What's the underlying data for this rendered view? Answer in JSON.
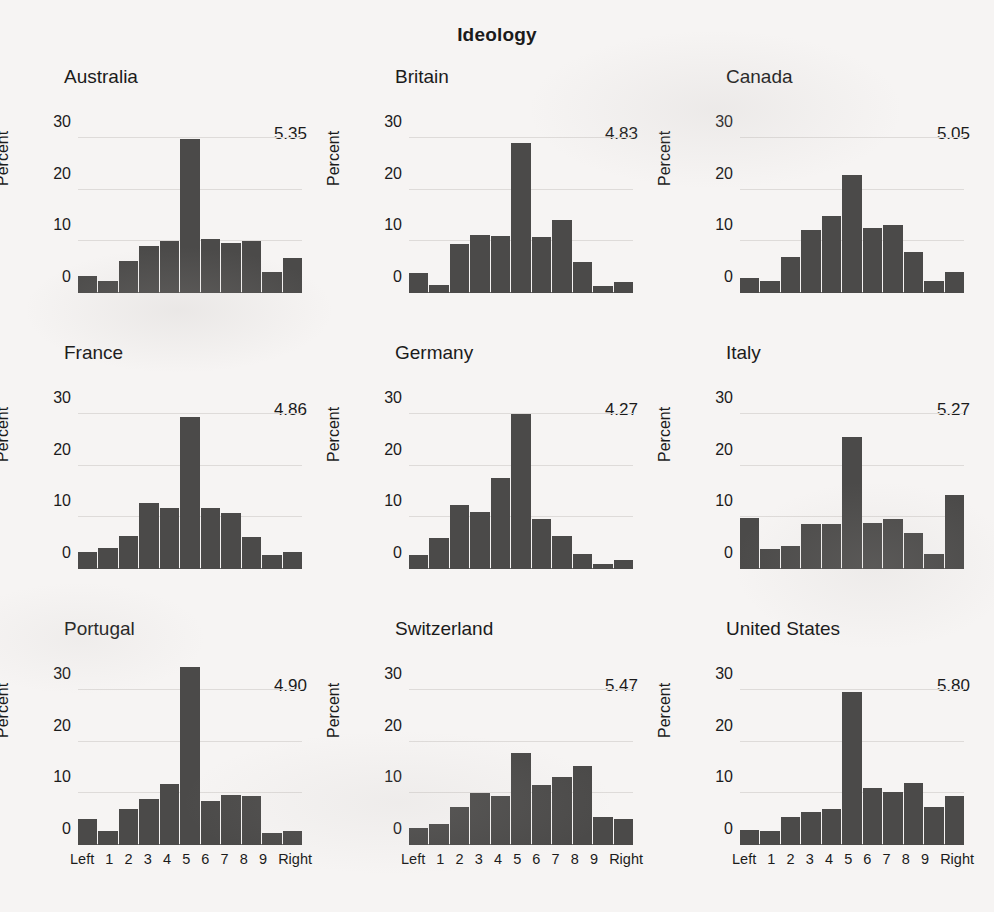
{
  "chart_data": {
    "type": "bar",
    "title": "Ideology",
    "ylabel": "Percent",
    "xlabel": "",
    "categories": [
      "Left",
      "1",
      "2",
      "3",
      "4",
      "5",
      "6",
      "7",
      "8",
      "9",
      "Right"
    ],
    "ytick_labels": [
      "0",
      "10",
      "20",
      "30"
    ],
    "ytick_values": [
      0,
      10,
      20,
      30
    ],
    "ylim": [
      0,
      36
    ],
    "grid": true,
    "legend": "none",
    "bar_color": "#4b4a49",
    "panels": [
      {
        "name": "Australia",
        "mean": "5.35",
        "values": [
          3.2,
          2.3,
          6.2,
          9.1,
          10.1,
          29.8,
          10.4,
          9.6,
          10.1,
          4.0,
          6.8
        ]
      },
      {
        "name": "Britain",
        "mean": "4.83",
        "values": [
          3.9,
          1.6,
          9.5,
          11.3,
          11.1,
          29.0,
          10.9,
          14.1,
          6.0,
          1.3,
          2.1
        ]
      },
      {
        "name": "Canada",
        "mean": "5.05",
        "values": [
          3.0,
          2.4,
          7.0,
          12.2,
          15.0,
          22.9,
          12.5,
          13.1,
          8.0,
          2.4,
          4.0
        ]
      },
      {
        "name": "France",
        "mean": "4.86",
        "values": [
          3.3,
          4.1,
          6.3,
          12.7,
          11.8,
          29.5,
          11.8,
          10.8,
          6.1,
          2.8,
          3.3
        ]
      },
      {
        "name": "Germany",
        "mean": "4.27",
        "values": [
          2.8,
          6.0,
          12.4,
          11.1,
          17.7,
          30.0,
          9.6,
          6.4,
          3.0,
          0.9,
          1.7
        ]
      },
      {
        "name": "Italy",
        "mean": "5.27",
        "values": [
          9.9,
          3.8,
          4.5,
          8.8,
          8.7,
          25.5,
          9.0,
          9.7,
          7.0,
          3.0,
          14.3
        ]
      },
      {
        "name": "Portugal",
        "mean": "4.90",
        "values": [
          5.0,
          2.8,
          7.0,
          9.0,
          11.8,
          34.5,
          8.6,
          9.7,
          9.4,
          2.4,
          2.7
        ]
      },
      {
        "name": "Switzerland",
        "mean": "5.47",
        "values": [
          3.2,
          4.0,
          7.3,
          10.0,
          9.5,
          17.8,
          11.6,
          13.1,
          15.2,
          5.4,
          5.1
        ]
      },
      {
        "name": "United States",
        "mean": "5.80",
        "values": [
          2.9,
          2.8,
          5.4,
          6.4,
          6.9,
          29.6,
          11.0,
          10.3,
          12.0,
          7.4,
          9.4
        ]
      }
    ],
    "xaxis_visible_on_rows": [
      3
    ]
  }
}
